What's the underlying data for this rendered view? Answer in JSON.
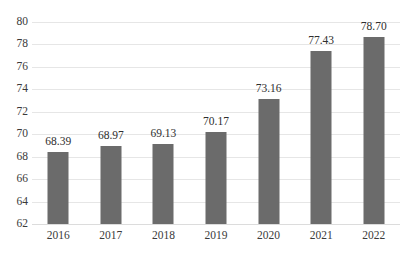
{
  "chart_data": {
    "type": "bar",
    "title": "",
    "subtitle": "",
    "xlabel": "",
    "ylabel": "",
    "categories": [
      "2016",
      "2017",
      "2018",
      "2019",
      "2020",
      "2021",
      "2022"
    ],
    "values": [
      68.39,
      68.97,
      69.13,
      70.17,
      73.16,
      77.43,
      78.7
    ],
    "data_labels": [
      "68.39",
      "68.97",
      "69.13",
      "70.17",
      "73.16",
      "77.43",
      "78.70"
    ],
    "ylim": [
      62,
      80
    ],
    "ytick_step": 2,
    "ytick_labels": [
      "80",
      "78",
      "76",
      "74",
      "72",
      "70",
      "68",
      "66",
      "64",
      "62"
    ],
    "ytick_values": [
      80,
      78,
      76,
      74,
      72,
      70,
      68,
      66,
      64,
      62
    ],
    "grid": true,
    "grid_axis": "y",
    "legend": false,
    "legend_position": "none",
    "series": [
      {
        "name": "",
        "values": [
          68.39,
          68.97,
          69.13,
          70.17,
          73.16,
          77.43,
          78.7
        ]
      }
    ],
    "colors": {
      "bar": "#6b6b6b",
      "gridline": "#e6e6e6",
      "baseline": "#dcdcdc",
      "background": "#ffffff",
      "tick_text": "#3a3a3a",
      "label_text": "#2e2e2e"
    }
  }
}
